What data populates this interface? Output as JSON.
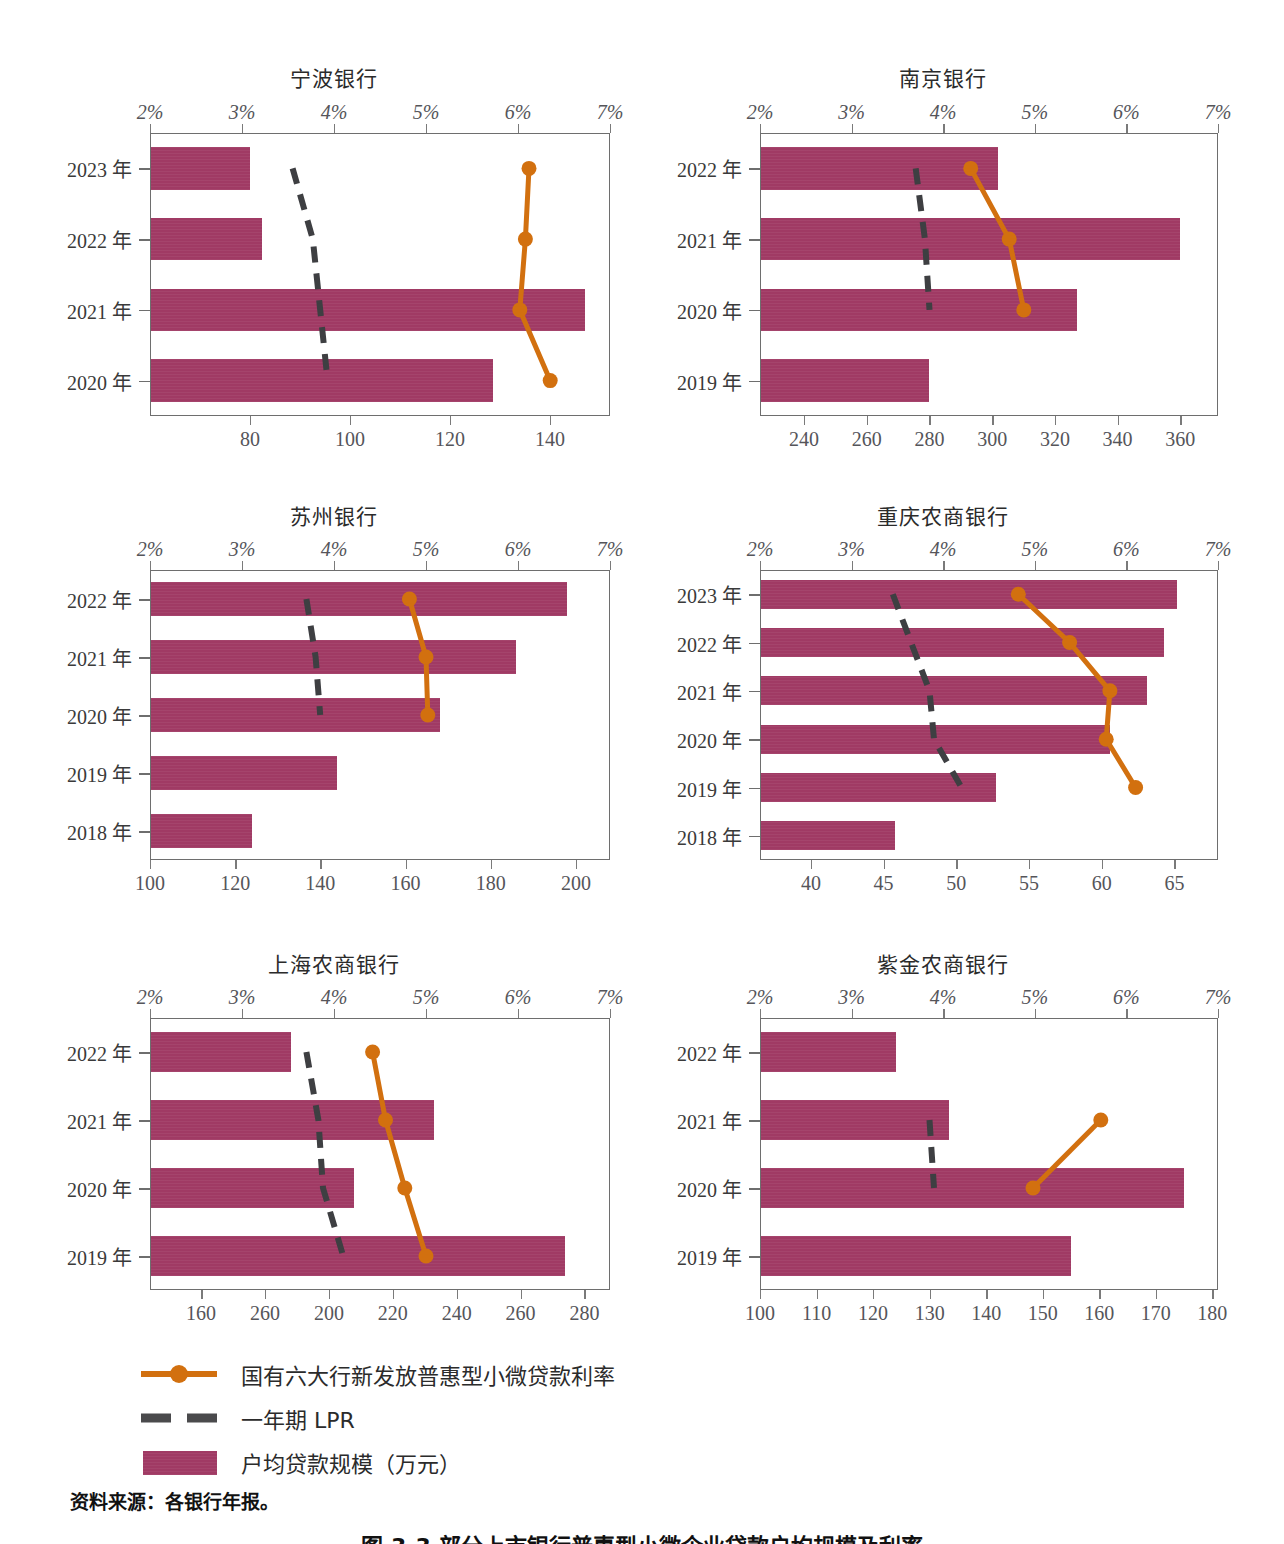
{
  "legend": {
    "items": [
      {
        "symbol": "line-marker",
        "label": "国有六大行新发放普惠型小微贷款利率",
        "color": "#d2700f"
      },
      {
        "symbol": "dashed-line",
        "label": "一年期 LPR",
        "color": "#3e3f42"
      },
      {
        "symbol": "bar-swatch",
        "label": "户均贷款规模（万元）",
        "color": "#a03a64"
      }
    ]
  },
  "source_note": "资料来源：各银行年报。",
  "figure_caption": "图 3-3 部分上市银行普惠型小微企业贷款户均规模及利率",
  "percent_axis": {
    "ticks": [
      "2%",
      "3%",
      "4%",
      "5%",
      "6%",
      "7%"
    ],
    "min": 2,
    "max": 7
  },
  "chart_data": [
    {
      "type": "bar",
      "title": "宁波银行",
      "categories": [
        "2023 年",
        "2022 年",
        "2021 年",
        "2020 年"
      ],
      "bar_series": {
        "name": "户均贷款规模（万元）",
        "values": [
          80.0,
          82.3,
          147.0,
          128.5
        ]
      },
      "bottom_axis": {
        "label": "",
        "ticks": [
          80,
          100,
          120,
          140
        ],
        "min": 60,
        "max": 152
      },
      "top_axis": {
        "label": "",
        "ticks": [
          2,
          3,
          4,
          5,
          6,
          7
        ],
        "min": 2,
        "max": 7
      },
      "line_series": [
        {
          "name": "国有六大行新发放普惠型小微贷款利率",
          "color": "#d2700f",
          "values": [
            6.12,
            6.08,
            6.02,
            6.35
          ]
        },
        {
          "name": "一年期 LPR",
          "color": "#3e3f42",
          "dashed": true,
          "values": [
            3.55,
            3.77,
            3.85,
            3.93
          ]
        }
      ]
    },
    {
      "type": "bar",
      "title": "南京银行",
      "categories": [
        "2022 年",
        "2021 年",
        "2020 年",
        "2019 年"
      ],
      "bar_series": {
        "name": "户均贷款规模（万元）",
        "values": [
          302.0,
          360.0,
          327.0,
          280.0
        ]
      },
      "bottom_axis": {
        "label": "",
        "ticks": [
          240,
          260,
          280,
          300,
          320,
          340,
          360
        ],
        "min": 226,
        "max": 372
      },
      "top_axis": {
        "label": "",
        "ticks": [
          2,
          3,
          4,
          5,
          6,
          7
        ],
        "min": 2,
        "max": 7
      },
      "line_series": [
        {
          "name": "国有六大行新发放普惠型小微贷款利率",
          "color": "#d2700f",
          "values": [
            4.3,
            4.72,
            4.88,
            null
          ]
        },
        {
          "name": "一年期 LPR",
          "color": "#3e3f42",
          "dashed": true,
          "values": [
            3.7,
            3.8,
            3.85,
            null
          ]
        }
      ]
    },
    {
      "type": "bar",
      "title": "苏州银行",
      "categories": [
        "2022 年",
        "2021 年",
        "2020 年",
        "2019 年",
        "2018 年"
      ],
      "bar_series": {
        "name": "户均贷款规模（万元）",
        "values": [
          198.0,
          186.0,
          168.0,
          144.0,
          124.0
        ]
      },
      "bottom_axis": {
        "label": "",
        "ticks": [
          100,
          120,
          140,
          160,
          180,
          200
        ],
        "min": 100,
        "max": 208
      },
      "top_axis": {
        "label": "",
        "ticks": [
          2,
          3,
          4,
          5,
          6,
          7
        ],
        "min": 2,
        "max": 7
      },
      "line_series": [
        {
          "name": "国有六大行新发放普惠型小微贷款利率",
          "color": "#d2700f",
          "values": [
            4.82,
            5.0,
            5.02,
            null,
            null
          ]
        },
        {
          "name": "一年期 LPR",
          "color": "#3e3f42",
          "dashed": true,
          "values": [
            3.7,
            3.8,
            3.85,
            null,
            null
          ]
        }
      ]
    },
    {
      "type": "bar",
      "title": "重庆农商银行",
      "categories": [
        "2023 年",
        "2022 年",
        "2021 年",
        "2020 年",
        "2019 年",
        "2018 年"
      ],
      "bar_series": {
        "name": "户均贷款规模（万元）",
        "values": [
          65.2,
          64.3,
          63.1,
          60.6,
          52.7,
          45.8
        ]
      },
      "bottom_axis": {
        "label": "",
        "ticks": [
          40,
          45,
          50,
          55,
          60,
          65
        ],
        "min": 36.5,
        "max": 68
      },
      "top_axis": {
        "label": "",
        "ticks": [
          2,
          3,
          4,
          5,
          6,
          7
        ],
        "min": 2,
        "max": 7
      },
      "line_series": [
        {
          "name": "国有六大行新发放普惠型小微贷款利率",
          "color": "#d2700f",
          "values": [
            4.82,
            5.38,
            5.82,
            5.78,
            6.1,
            null
          ]
        },
        {
          "name": "一年期 LPR",
          "color": "#3e3f42",
          "dashed": true,
          "values": [
            3.45,
            3.65,
            3.85,
            3.9,
            4.2,
            null
          ]
        }
      ]
    },
    {
      "type": "bar",
      "title": "上海农商银行",
      "categories": [
        "2022 年",
        "2021 年",
        "2020 年",
        "2019 年"
      ],
      "bar_series": {
        "name": "户均贷款规模（万元）",
        "values": [
          188.0,
          233.0,
          208.0,
          274.0
        ]
      },
      "bottom_axis": {
        "label": "",
        "ticks": [
          160,
          260,
          200,
          220,
          240,
          260,
          280
        ],
        "min": 144,
        "max": 288
      },
      "top_axis": {
        "label": "",
        "ticks": [
          2,
          3,
          4,
          5,
          6,
          7
        ],
        "min": 2,
        "max": 7
      },
      "line_series": [
        {
          "name": "国有六大行新发放普惠型小微贷款利率",
          "color": "#d2700f",
          "values": [
            4.42,
            4.56,
            4.77,
            5.0
          ]
        },
        {
          "name": "一年期 LPR",
          "color": "#3e3f42",
          "dashed": true,
          "values": [
            3.7,
            3.83,
            3.88,
            4.1
          ]
        }
      ]
    },
    {
      "type": "bar",
      "title": "紫金农商银行",
      "categories": [
        "2022 年",
        "2021 年",
        "2020 年",
        "2019 年"
      ],
      "bar_series": {
        "name": "户均贷款规模（万元）",
        "values": [
          124.0,
          133.5,
          175.0,
          155.0
        ]
      },
      "bottom_axis": {
        "label": "",
        "ticks": [
          100,
          110,
          120,
          130,
          140,
          150,
          160,
          170,
          180
        ],
        "min": 100,
        "max": 181
      },
      "top_axis": {
        "label": "",
        "ticks": [
          2,
          3,
          4,
          5,
          6,
          7
        ],
        "min": 2,
        "max": 7
      },
      "line_series": [
        {
          "name": "国有六大行新发放普惠型小微贷款利率",
          "color": "#d2700f",
          "values": [
            null,
            5.72,
            4.98,
            null
          ]
        },
        {
          "name": "一年期 LPR",
          "color": "#3e3f42",
          "dashed": true,
          "values": [
            null,
            3.85,
            3.9,
            null
          ]
        }
      ]
    }
  ]
}
